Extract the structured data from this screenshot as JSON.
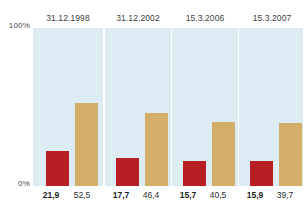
{
  "chart_data": {
    "type": "bar",
    "title": "",
    "subtitle": "",
    "xlabel": "",
    "ylabel": "",
    "ylim": [
      0,
      100
    ],
    "grid": false,
    "legend_position": "none",
    "axis_ticks": [
      "0%",
      "100%"
    ],
    "categories": [
      "31.12.1998",
      "31.12.2002",
      "15.3.2006",
      "15.3.2007"
    ],
    "series": [
      {
        "name": "red",
        "color": "#b81f24",
        "values": [
          21.9,
          17.7,
          15.7,
          15.9
        ],
        "labels": [
          "21,9",
          "17,7",
          "15,7",
          "15,9"
        ]
      },
      {
        "name": "tan",
        "color": "#d2ae68",
        "values": [
          52.5,
          46.4,
          40.5,
          39.7
        ],
        "labels": [
          "52,5",
          "46,4",
          "40,5",
          "39,7"
        ]
      }
    ]
  },
  "axis": {
    "top_label": "100%",
    "bottom_label": "0%"
  },
  "panels": [
    {
      "header": "31.12.1998",
      "red_label": "21,9",
      "tan_label": "52,5"
    },
    {
      "header": "31.12.2002",
      "red_label": "17,7",
      "tan_label": "46,4"
    },
    {
      "header": "15.3.2006",
      "red_label": "15,7",
      "tan_label": "40,5"
    },
    {
      "header": "15.3.2007",
      "red_label": "15,9",
      "tan_label": "39,7"
    }
  ],
  "colors": {
    "panel_background": "#dcebf4",
    "red_bar": "#b81f24",
    "tan_bar": "#d2ae68",
    "text": "#1c1c1c",
    "page_background": "#ffffff"
  }
}
